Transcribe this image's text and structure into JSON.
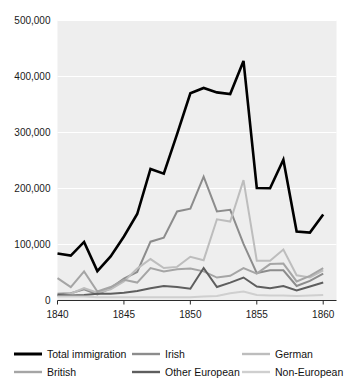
{
  "chart_data": {
    "type": "line",
    "title": "",
    "xlabel": "",
    "ylabel": "",
    "xlim": [
      1840,
      1861
    ],
    "ylim": [
      0,
      500000
    ],
    "grid": true,
    "legend_position": "bottom",
    "x": [
      1840,
      1841,
      1842,
      1843,
      1844,
      1845,
      1846,
      1847,
      1848,
      1849,
      1850,
      1851,
      1852,
      1853,
      1854,
      1855,
      1856,
      1857,
      1858,
      1859,
      1860
    ],
    "y_ticks": [
      0,
      100000,
      200000,
      300000,
      400000,
      500000
    ],
    "y_tick_labels": [
      "0",
      "100,000",
      "200,000",
      "300,000",
      "400,000",
      "500,000"
    ],
    "x_ticks": [
      1840,
      1845,
      1850,
      1855,
      1860
    ],
    "x_tick_labels": [
      "1840",
      "1845",
      "1850",
      "1855",
      "1860"
    ],
    "series": [
      {
        "name": "Total immigration",
        "color": "#000000",
        "width": 2.6,
        "values": [
          84066,
          80289,
          104565,
          52496,
          78615,
          114371,
          154416,
          234968,
          226527,
          297024,
          369980,
          379466,
          371603,
          368645,
          427833,
          200877,
          200436,
          251306,
          123126,
          121282,
          153640
        ]
      },
      {
        "name": "Irish",
        "color": "#8c8c8c",
        "width": 2.0,
        "values": [
          12000,
          13000,
          20000,
          11000,
          22000,
          39000,
          51000,
          105000,
          112000,
          159000,
          164000,
          221000,
          159000,
          162000,
          101000,
          49000,
          54000,
          54000,
          26000,
          35000,
          48000
        ]
      },
      {
        "name": "German",
        "color": "#bdbdbd",
        "width": 2.0,
        "values": [
          8000,
          12000,
          22000,
          14000,
          20000,
          34000,
          57000,
          74000,
          58000,
          60000,
          78000,
          72000,
          145000,
          141000,
          215000,
          71000,
          71000,
          91000,
          45000,
          41000,
          54000
        ]
      },
      {
        "name": "British",
        "color": "#a5a5a5",
        "width": 2.0,
        "values": [
          40000,
          24000,
          52000,
          16000,
          24000,
          37000,
          32000,
          58000,
          52000,
          56000,
          57000,
          52000,
          41000,
          44000,
          58000,
          48000,
          65000,
          66000,
          34000,
          44000,
          58000
        ]
      },
      {
        "name": "Other European",
        "color": "#5e5e5e",
        "width": 2.0,
        "values": [
          10000,
          9000,
          10000,
          12000,
          12000,
          14000,
          17000,
          22000,
          26000,
          24000,
          21000,
          58000,
          24000,
          32000,
          41000,
          25000,
          22000,
          26000,
          18000,
          25000,
          32000
        ]
      },
      {
        "name": "Non-European",
        "color": "#cfcfcf",
        "width": 2.0,
        "values": [
          7000,
          7000,
          7000,
          6000,
          6000,
          6000,
          6000,
          6000,
          6000,
          6000,
          6000,
          7000,
          8000,
          13000,
          16000,
          10000,
          9000,
          9000,
          8000,
          9000,
          10000
        ]
      }
    ]
  },
  "legend": {
    "items": [
      {
        "label": "Total immigration",
        "color": "#000000",
        "width": 3.0
      },
      {
        "label": "Irish",
        "color": "#8c8c8c",
        "width": 2.4
      },
      {
        "label": "German",
        "color": "#bdbdbd",
        "width": 2.4
      },
      {
        "label": "British",
        "color": "#a5a5a5",
        "width": 2.4
      },
      {
        "label": "Other European",
        "color": "#5e5e5e",
        "width": 2.4
      },
      {
        "label": "Non-European",
        "color": "#cfcfcf",
        "width": 2.4
      }
    ]
  }
}
